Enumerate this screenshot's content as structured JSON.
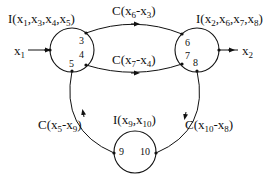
{
  "nodes": [
    {
      "id": "left",
      "label": "I(x1,x3,x4,x5)",
      "label_parts": [
        [
          "I(x",
          ""
        ],
        [
          "1",
          ","
        ],
        [
          "x",
          ""
        ],
        [
          "3",
          ","
        ],
        [
          "x",
          ""
        ],
        [
          "4",
          ","
        ],
        [
          "x",
          ""
        ],
        [
          "5",
          ")"
        ]
      ],
      "ports": [
        "3",
        "4",
        "5"
      ]
    },
    {
      "id": "right",
      "label": "I(x2,x6,x7,x8)",
      "ports": [
        "6",
        "7",
        "8"
      ]
    },
    {
      "id": "bottom",
      "label": "I(x9,x10)",
      "ports": [
        "9",
        "10"
      ]
    }
  ],
  "edges": [
    {
      "from": "3",
      "to": "6",
      "label": "C(x6-x3)"
    },
    {
      "from": "4",
      "to": "7",
      "label": "C(x7-x4)"
    },
    {
      "from": "9",
      "to": "5",
      "label": "C(x5-x9)"
    },
    {
      "from": "8",
      "to": "10",
      "label": "C(x10-x8)"
    }
  ],
  "inputs": [
    {
      "label": "x1",
      "to": "left"
    }
  ],
  "outputs": [
    {
      "label": "x2",
      "from": "right"
    }
  ],
  "text": {
    "left_node": "I(x1,x3,x4,x5)",
    "right_node": "I(x2,x6,x7,x8)",
    "bottom_node": "I(x9,x10)",
    "edge_top": "C(x6-x3)",
    "edge_mid": "C(x7-x4)",
    "edge_left": "C(x5-x9)",
    "edge_right": "C(x10-x8)",
    "input": "x1",
    "output": "x2",
    "p3": "3",
    "p4": "4",
    "p5": "5",
    "p6": "6",
    "p7": "7",
    "p8": "8",
    "p9": "9",
    "p10": "10"
  }
}
